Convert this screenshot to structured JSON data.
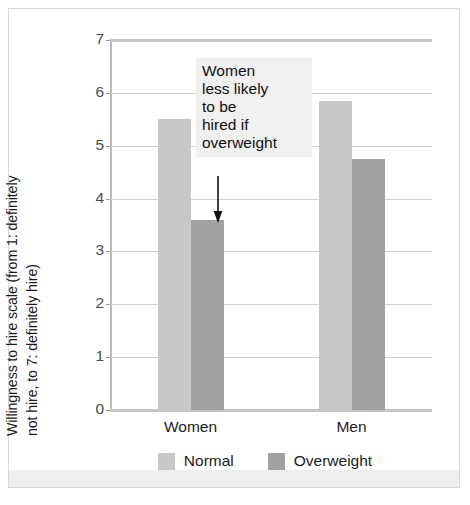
{
  "chart_data": {
    "type": "bar",
    "title": "",
    "xlabel": "",
    "ylabel": "Willingness to hire scale (from 1: definitely not hire, to 7: definitely hire)",
    "ylabel_lines": [
      "Willingness to hire scale (from 1: definitely",
      "not hire, to 7: definitely hire)"
    ],
    "categories": [
      "Women",
      "Men"
    ],
    "series": [
      {
        "name": "Normal",
        "color": "#c8c8c8",
        "values": [
          5.5,
          5.85
        ]
      },
      {
        "name": "Overweight",
        "color": "#a2a2a2",
        "values": [
          3.6,
          4.75
        ]
      }
    ],
    "ylim": [
      0,
      7
    ],
    "yticks": [
      0,
      1,
      2,
      3,
      4,
      5,
      6,
      7
    ],
    "ytick_labels": [
      "0",
      "1",
      "2",
      "3",
      "4",
      "5",
      "6",
      "7"
    ],
    "grid": true,
    "legend_position": "bottom",
    "annotations": [
      {
        "text": "Women less likely to be hired if overweight",
        "lines": [
          "Women",
          "less likely",
          "to be",
          "hired if",
          "overweight"
        ],
        "points_to_series": "Overweight",
        "points_to_category": "Women",
        "has_arrow": true
      }
    ]
  },
  "figure": {
    "background": "#ffffff",
    "frame_color": "#d8d8d8",
    "gridline_color": "#cfcfcf",
    "axis_color": "#b9b9b9",
    "annotation_background": "#f0f0f0",
    "text_color": "#1a1a1a"
  }
}
